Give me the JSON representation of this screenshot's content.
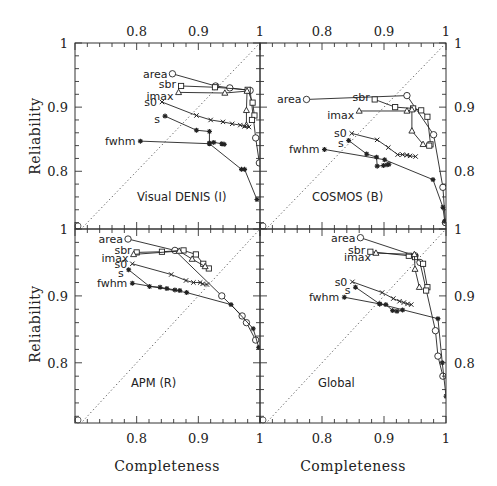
{
  "chart_data": {
    "type": "line",
    "layout": "2x2 grid of panels sharing axes",
    "xlabel": "Completeness",
    "ylabel": "Reliability",
    "xlim": [
      0.7,
      1.0
    ],
    "ylim": [
      0.71,
      1.0
    ],
    "x_ticks": [
      "0.8",
      "0.9",
      "1"
    ],
    "y_ticks": [
      "0.8",
      "0.9",
      "1"
    ],
    "grid": false,
    "diagonal_reference": "dotted line y = x",
    "series_names": [
      "area",
      "sbr",
      "imax",
      "s0",
      "s",
      "fwhm"
    ],
    "markers": {
      "area": "circle",
      "sbr": "square",
      "imax": "triangle",
      "s0": "cross",
      "s": "star",
      "fwhm": "star"
    },
    "panels": [
      {
        "title": "Visual DENIS (I)",
        "series": [
          {
            "name": "area",
            "x": [
              0.858,
              0.928,
              0.951,
              0.984,
              0.993,
              0.999
            ],
            "y": [
              0.952,
              0.933,
              0.93,
              0.926,
              0.852,
              0.813
            ]
          },
          {
            "name": "sbr",
            "x": [
              0.872,
              0.927,
              0.98,
              0.988,
              0.991,
              0.987
            ],
            "y": [
              0.933,
              0.931,
              0.927,
              0.907,
              0.887,
              0.88
            ]
          },
          {
            "name": "imax",
            "x": [
              0.868,
              0.943,
              0.979,
              0.978,
              0.978
            ],
            "y": [
              0.923,
              0.922,
              0.925,
              0.895,
              0.872
            ]
          },
          {
            "name": "s0",
            "x": [
              0.841,
              0.897,
              0.92,
              0.94,
              0.955,
              0.968,
              0.975,
              0.982
            ],
            "y": [
              0.908,
              0.887,
              0.88,
              0.877,
              0.874,
              0.872,
              0.87,
              0.869
            ]
          },
          {
            "name": "s",
            "x": [
              0.846,
              0.897,
              0.918,
              0.918,
              0.925,
              0.938,
              0.942
            ],
            "y": [
              0.886,
              0.864,
              0.862,
              0.844,
              0.845,
              0.843,
              0.842
            ]
          },
          {
            "name": "fwhm",
            "x": [
              0.806,
              0.918,
              0.97,
              0.975,
              0.995
            ],
            "y": [
              0.847,
              0.843,
              0.803,
              0.803,
              0.756
            ]
          }
        ]
      },
      {
        "title": "COSMOS (B)",
        "series": [
          {
            "name": "area",
            "x": [
              0.775,
              0.937,
              0.98,
              0.995,
              0.999
            ],
            "y": [
              0.912,
              0.918,
              0.857,
              0.775,
              0.72
            ]
          },
          {
            "name": "sbr",
            "x": [
              0.885,
              0.918,
              0.947,
              0.96,
              0.97,
              0.975,
              0.973
            ],
            "y": [
              0.912,
              0.9,
              0.898,
              0.895,
              0.885,
              0.842,
              0.84
            ]
          },
          {
            "name": "imax",
            "x": [
              0.86,
              0.937,
              0.945,
              0.945,
              0.963
            ],
            "y": [
              0.894,
              0.894,
              0.896,
              0.863,
              0.842
            ]
          },
          {
            "name": "s0",
            "x": [
              0.848,
              0.889,
              0.907,
              0.922,
              0.93,
              0.937,
              0.942,
              0.951
            ],
            "y": [
              0.859,
              0.849,
              0.837,
              0.826,
              0.826,
              0.825,
              0.824,
              0.823
            ]
          },
          {
            "name": "s",
            "x": [
              0.843,
              0.872,
              0.888,
              0.889,
              0.899,
              0.905,
              0.908
            ],
            "y": [
              0.848,
              0.827,
              0.822,
              0.808,
              0.809,
              0.81,
              0.811
            ]
          },
          {
            "name": "fwhm",
            "x": [
              0.804,
              0.901,
              0.979,
              0.995,
              0.998
            ],
            "y": [
              0.834,
              0.818,
              0.787,
              0.744,
              0.722
            ]
          }
        ]
      },
      {
        "title": "APM (R)",
        "series": [
          {
            "name": "area",
            "x": [
              0.786,
              0.862,
              0.938,
              0.971,
              0.978,
              0.993
            ],
            "y": [
              0.985,
              0.968,
              0.9,
              0.87,
              0.86,
              0.834
            ]
          },
          {
            "name": "sbr",
            "x": [
              0.8,
              0.841,
              0.876,
              0.896,
              0.908,
              0.917
            ],
            "y": [
              0.965,
              0.966,
              0.968,
              0.962,
              0.948,
              0.941
            ]
          },
          {
            "name": "imax",
            "x": [
              0.795,
              0.869,
              0.89,
              0.911
            ],
            "y": [
              0.962,
              0.967,
              0.955,
              0.944
            ]
          },
          {
            "name": "s0",
            "x": [
              0.793,
              0.856,
              0.88,
              0.892,
              0.903,
              0.907,
              0.914
            ],
            "y": [
              0.948,
              0.932,
              0.923,
              0.92,
              0.92,
              0.918,
              0.917
            ]
          },
          {
            "name": "s",
            "x": [
              0.787,
              0.821,
              0.838,
              0.849,
              0.862,
              0.87
            ],
            "y": [
              0.939,
              0.914,
              0.913,
              0.911,
              0.909,
              0.908
            ]
          },
          {
            "name": "fwhm",
            "x": [
              0.793,
              0.881,
              0.953,
              0.989,
              0.998
            ],
            "y": [
              0.919,
              0.905,
              0.887,
              0.851,
              0.823
            ]
          }
        ]
      },
      {
        "title": "Global",
        "series": [
          {
            "name": "area",
            "x": [
              0.862,
              0.95,
              0.958,
              0.983,
              0.987,
              0.995
            ],
            "y": [
              0.987,
              0.96,
              0.95,
              0.848,
              0.81,
              0.78
            ]
          },
          {
            "name": "sbr",
            "x": [
              0.878,
              0.94,
              0.95,
              0.963,
              0.97,
              0.968
            ],
            "y": [
              0.966,
              0.96,
              0.958,
              0.948,
              0.913,
              0.908
            ]
          },
          {
            "name": "imax",
            "x": [
              0.887,
              0.949,
              0.95,
              0.957
            ],
            "y": [
              0.964,
              0.962,
              0.94,
              0.913
            ]
          },
          {
            "name": "s0",
            "x": [
              0.849,
              0.897,
              0.915,
              0.925,
              0.932,
              0.938,
              0.944
            ],
            "y": [
              0.921,
              0.905,
              0.896,
              0.892,
              0.89,
              0.888,
              0.887
            ]
          },
          {
            "name": "s",
            "x": [
              0.854,
              0.893,
              0.903,
              0.914,
              0.921,
              0.93
            ],
            "y": [
              0.913,
              0.888,
              0.887,
              0.878,
              0.877,
              0.879
            ]
          },
          {
            "name": "fwhm",
            "x": [
              0.836,
              0.893,
              0.987,
              0.994,
              1.0
            ],
            "y": [
              0.898,
              0.888,
              0.866,
              0.8,
              0.75
            ]
          }
        ]
      }
    ]
  },
  "figure": {
    "xlabel": "Completeness",
    "ylabel": "Reliability",
    "x_tick_labels": [
      "0.8",
      "0.9",
      "1"
    ],
    "y_tick_labels": [
      "0.8",
      "0.9",
      "1"
    ],
    "panel_titles": [
      "Visual DENIS (I)",
      "COSMOS (B)",
      "APM (R)",
      "Global"
    ]
  }
}
